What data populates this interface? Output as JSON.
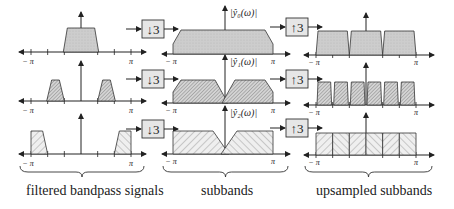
{
  "figure": {
    "columns": [
      {
        "id": "filtered",
        "caption": "filtered bandpass signals"
      },
      {
        "id": "subbands",
        "caption": "subbands"
      },
      {
        "id": "upsampled",
        "caption": "upsampled subbands"
      }
    ],
    "axis_labels": {
      "neg_pi": "− π",
      "pos_pi": "π"
    },
    "downsampler": {
      "arrow": "↓",
      "factor": "3"
    },
    "upsampler": {
      "arrow": "↑",
      "factor": "3"
    },
    "subband_labels": [
      {
        "text": "|ŷ₀(ω)|"
      },
      {
        "text": "|ŷ₁(ω)|"
      },
      {
        "text": "|ŷ₂(ω)|"
      }
    ],
    "rows": [
      {
        "band": 0,
        "fill": "dense-gray",
        "description": "lowpass band centered at 0"
      },
      {
        "band": 1,
        "fill": "fine-hatch",
        "description": "middle bandpass"
      },
      {
        "band": 2,
        "fill": "diagonal-hatch",
        "description": "highpass band near ±π"
      }
    ],
    "colors": {
      "line": "#222222",
      "fill_gray": "#cfcfcf",
      "box_fill": "#e6e6e6"
    }
  }
}
